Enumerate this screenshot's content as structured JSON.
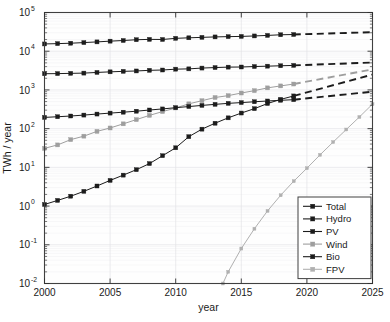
{
  "chart_data": {
    "type": "line",
    "title": "",
    "xlabel": "year",
    "ylabel": "TWh / year",
    "xlim": [
      2000,
      2025
    ],
    "ylim": [
      0.01,
      100000
    ],
    "yscale": "log",
    "xscale": "linear",
    "grid": true,
    "xticks": [
      2000,
      2005,
      2010,
      2015,
      2020,
      2025
    ],
    "xticklabels": [
      "2000",
      "2005",
      "2010",
      "2015",
      "2020",
      "2025"
    ],
    "yticks": [
      0.01,
      0.1,
      1,
      10,
      100,
      1000,
      10000,
      100000
    ],
    "yticklabels": [
      "10-2",
      "10-1",
      "100",
      "101",
      "102",
      "103",
      "104",
      "105"
    ],
    "ytick_bases": [
      "10",
      "10",
      "10",
      "10",
      "10",
      "10",
      "10",
      "10"
    ],
    "ytick_exponents": [
      "-2",
      "-1",
      "0",
      "1",
      "2",
      "3",
      "4",
      "5"
    ],
    "legend_position": "lower right",
    "legend_entries": [
      "Total",
      "Hydro",
      "PV",
      "Wind",
      "Bio",
      "FPV"
    ],
    "series": [
      {
        "name": "Total",
        "color": "#1c1c1c",
        "marker": "square",
        "linestyle": "solid",
        "x": [
          2000,
          2001,
          2002,
          2003,
          2004,
          2005,
          2006,
          2007,
          2008,
          2009,
          2010,
          2011,
          2012,
          2013,
          2014,
          2015,
          2016,
          2017,
          2018,
          2019
        ],
        "values": [
          15400,
          15700,
          16100,
          16700,
          17400,
          18200,
          18900,
          19800,
          20200,
          20100,
          21500,
          22200,
          22800,
          23400,
          23800,
          24100,
          24800,
          25600,
          26600,
          27000
        ]
      },
      {
        "name": "Hydro",
        "color": "#1c1c1c",
        "marker": "square",
        "linestyle": "solid",
        "x": [
          2000,
          2001,
          2002,
          2003,
          2004,
          2005,
          2006,
          2007,
          2008,
          2009,
          2010,
          2011,
          2012,
          2013,
          2014,
          2015,
          2016,
          2017,
          2018,
          2019
        ],
        "values": [
          2620,
          2640,
          2680,
          2720,
          2830,
          2930,
          3020,
          3090,
          3210,
          3270,
          3440,
          3500,
          3670,
          3780,
          3880,
          3910,
          4020,
          4110,
          4210,
          4300
        ]
      },
      {
        "name": "PV",
        "color": "#1c1c1c",
        "marker": "square",
        "linestyle": "solid",
        "x": [
          2000,
          2001,
          2002,
          2003,
          2004,
          2005,
          2006,
          2007,
          2008,
          2009,
          2010,
          2011,
          2012,
          2013,
          2014,
          2015,
          2016,
          2017,
          2018,
          2019
        ],
        "values": [
          1.1,
          1.4,
          1.8,
          2.4,
          3.3,
          4.6,
          6.3,
          8.7,
          12.5,
          20,
          32,
          62,
          97,
          138,
          190,
          253,
          328,
          445,
          570,
          700
        ]
      },
      {
        "name": "Wind",
        "color": "#9e9e9e",
        "marker": "square",
        "linestyle": "solid",
        "x": [
          2000,
          2001,
          2002,
          2003,
          2004,
          2005,
          2006,
          2007,
          2008,
          2009,
          2010,
          2011,
          2012,
          2013,
          2014,
          2015,
          2016,
          2017,
          2018,
          2019
        ],
        "values": [
          31,
          38,
          52,
          64,
          85,
          104,
          133,
          171,
          220,
          276,
          342,
          437,
          527,
          637,
          712,
          832,
          958,
          1130,
          1270,
          1420
        ]
      },
      {
        "name": "Bio",
        "color": "#1c1c1c",
        "marker": "square",
        "linestyle": "solid",
        "x": [
          2000,
          2001,
          2002,
          2003,
          2004,
          2005,
          2006,
          2007,
          2008,
          2009,
          2010,
          2011,
          2012,
          2013,
          2014,
          2015,
          2016,
          2017,
          2018,
          2019
        ],
        "values": [
          195,
          203,
          212,
          224,
          238,
          252,
          266,
          282,
          303,
          323,
          348,
          372,
          398,
          424,
          450,
          471,
          495,
          518,
          540,
          560
        ]
      },
      {
        "name": "FPV",
        "color": "#b0b0b0",
        "marker": "square",
        "linestyle": "solid",
        "x": [
          2013.6,
          2014,
          2015,
          2016,
          2017,
          2018,
          2019,
          2020,
          2021,
          2022,
          2023,
          2024,
          2025
        ],
        "values": [
          0.01,
          0.02,
          0.08,
          0.26,
          0.75,
          1.9,
          4.4,
          9.5,
          21,
          45,
          95,
          200,
          430
        ]
      }
    ],
    "extrapolations": [
      {
        "name": "Total",
        "color": "#1c1c1c",
        "linestyle": "dashed",
        "x": [
          2019,
          2025
        ],
        "values": [
          27000,
          31000
        ]
      },
      {
        "name": "Hydro",
        "color": "#1c1c1c",
        "linestyle": "dashed",
        "x": [
          2019,
          2025
        ],
        "values": [
          4300,
          5100
        ]
      },
      {
        "name": "PV",
        "color": "#1c1c1c",
        "linestyle": "dashed",
        "x": [
          2019,
          2025
        ],
        "values": [
          700,
          2500
        ]
      },
      {
        "name": "Wind",
        "color": "#9e9e9e",
        "linestyle": "dashed",
        "x": [
          2019,
          2025
        ],
        "values": [
          1420,
          3400
        ]
      },
      {
        "name": "Bio",
        "color": "#1c1c1c",
        "linestyle": "dashed",
        "x": [
          2019,
          2025
        ],
        "values": [
          560,
          900
        ]
      }
    ]
  }
}
